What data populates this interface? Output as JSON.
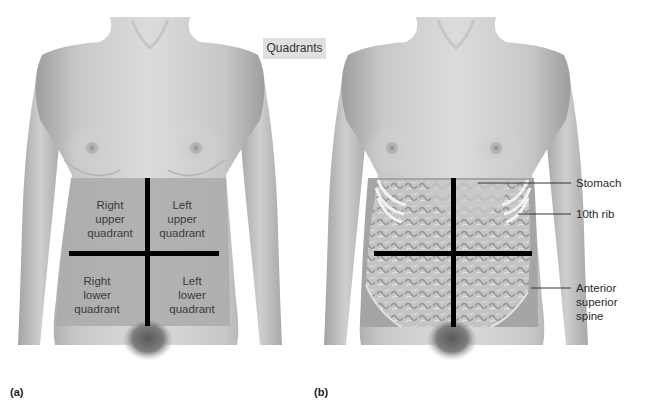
{
  "figure": {
    "title_badge": "Quadrants",
    "panels": [
      {
        "id": "a",
        "letter": "(a)",
        "quadrants": {
          "right_upper": [
            "Right",
            "upper",
            "quadrant"
          ],
          "left_upper": [
            "Left",
            "upper",
            "quadrant"
          ],
          "right_lower": [
            "Right",
            "lower",
            "quadrant"
          ],
          "left_lower": [
            "Left",
            "lower",
            "quadrant"
          ]
        }
      },
      {
        "id": "b",
        "letter": "(b)",
        "callouts": [
          {
            "label": "Stomach"
          },
          {
            "label": "10th rib"
          },
          {
            "label": "Anterior",
            "label2": "superior",
            "label3": "spine"
          }
        ]
      }
    ],
    "colors": {
      "skin_light": "#d9d9d9",
      "skin_mid": "#bdbdbd",
      "skin_dark": "#9a9a9a",
      "quadrant_shade": "#a9a9a9",
      "divider_line": "#000000",
      "badge_bg": "#e0e0e0"
    }
  }
}
